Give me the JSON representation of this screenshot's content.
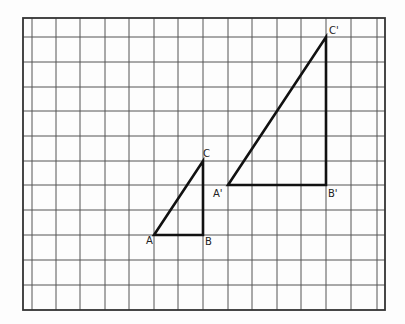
{
  "diagram": {
    "type": "coordinate-grid-dilation",
    "grid": {
      "left": 23,
      "top": 18,
      "right": 385,
      "bottom": 310,
      "vlines": [
        32,
        56,
        80,
        105,
        129,
        154,
        178,
        203,
        228,
        252,
        277,
        301,
        326,
        351,
        377
      ],
      "hlines": [
        37,
        62,
        87,
        111,
        136,
        161,
        185,
        210,
        235,
        260,
        285
      ]
    },
    "triangles": [
      {
        "name": "ABC",
        "points": [
          [
            154,
            235
          ],
          [
            203,
            235
          ],
          [
            203,
            161
          ]
        ]
      },
      {
        "name": "A'B'C'",
        "points": [
          [
            228,
            185
          ],
          [
            326,
            185
          ],
          [
            326,
            37
          ]
        ]
      }
    ],
    "labels": [
      {
        "text": "A",
        "x": 146,
        "y": 244
      },
      {
        "text": "B",
        "x": 205,
        "y": 245
      },
      {
        "text": "C",
        "x": 203,
        "y": 157
      },
      {
        "text": "A'",
        "x": 213,
        "y": 197
      },
      {
        "text": "B'",
        "x": 328,
        "y": 197
      },
      {
        "text": "C'",
        "x": 329,
        "y": 34
      }
    ]
  }
}
